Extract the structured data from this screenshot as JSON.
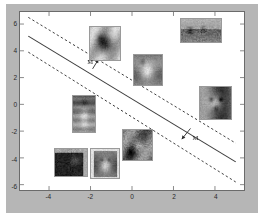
{
  "figure": {
    "background_color": "#b6b6b6",
    "axes_background": "#ffffff",
    "axes_border_color": "#6b6b6b"
  },
  "chart_data": {
    "type": "scatter",
    "title": "",
    "subtitle": "",
    "xlabel": "",
    "ylabel": "",
    "xlim": [
      -5.4,
      5.4
    ],
    "ylim": [
      -6.4,
      6.9
    ],
    "grid": false,
    "legend": null,
    "xticks": [
      -4,
      -2,
      0,
      2,
      4
    ],
    "xtick_labels": [
      "-4",
      "-2",
      "0",
      "2",
      "4"
    ],
    "yticks": [
      -6,
      -4,
      -2,
      0,
      2,
      4,
      6
    ],
    "ytick_labels": [
      "-6",
      "-4",
      "-2",
      "0",
      "2",
      "4",
      "6"
    ],
    "lines": [
      {
        "name": "decision-boundary",
        "style": "solid",
        "color": "#3d3d3d",
        "width": 1.1,
        "x": [
          -5.0,
          5.0
        ],
        "y": [
          5.1,
          -4.3
        ]
      },
      {
        "name": "upper-margin",
        "style": "dashed",
        "color": "#3d3d3d",
        "width": 1.0,
        "x": [
          -5.0,
          5.0
        ],
        "y": [
          6.5,
          -2.9
        ]
      },
      {
        "name": "lower-margin",
        "style": "dashed",
        "color": "#3d3d3d",
        "width": 1.0,
        "x": [
          -5.0,
          5.0
        ],
        "y": [
          3.9,
          -5.8
        ]
      }
    ],
    "annotations": [
      {
        "name": "margin-label-upper",
        "text": "M",
        "text_x": -2.05,
        "text_y": 3.25,
        "arrow_from_x": -1.9,
        "arrow_from_y": 2.65,
        "arrow_to_x": -1.62,
        "arrow_to_y": 3.35
      },
      {
        "name": "margin-label-lower",
        "text": "M",
        "text_x": 2.98,
        "text_y": -2.35,
        "arrow_from_x": 2.82,
        "arrow_from_y": -1.8,
        "arrow_to_x": 2.4,
        "arrow_to_y": -2.6
      }
    ],
    "points": [
      {
        "name": "thumbnail-dark-dog",
        "label": "dark dog photo",
        "x": -1.35,
        "y": 4.55,
        "width_px": 32,
        "height_px": 35,
        "texture": "dark-dog"
      },
      {
        "name": "thumbnail-landscape",
        "label": "outdoor landscape photo",
        "x": 3.25,
        "y": 5.55,
        "width_px": 42,
        "height_px": 25,
        "texture": "landscape"
      },
      {
        "name": "thumbnail-light-cat",
        "label": "light cat photo",
        "x": 0.72,
        "y": 2.65,
        "width_px": 30,
        "height_px": 32,
        "texture": "light-cat"
      },
      {
        "name": "thumbnail-bulldog",
        "label": "bulldog face photo",
        "x": 3.95,
        "y": 0.15,
        "width_px": 33,
        "height_px": 34,
        "texture": "bulldog"
      },
      {
        "name": "thumbnail-sitting-cat",
        "label": "sitting cat portrait photo",
        "x": -2.35,
        "y": -0.65,
        "width_px": 24,
        "height_px": 38,
        "texture": "sitting-cat"
      },
      {
        "name": "thumbnail-cat-face",
        "label": "cat face close-up photo",
        "x": 0.2,
        "y": -2.9,
        "width_px": 31,
        "height_px": 32,
        "texture": "cat-face"
      },
      {
        "name": "thumbnail-black-cat",
        "label": "black cat photo",
        "x": -2.95,
        "y": -4.25,
        "width_px": 34,
        "height_px": 29,
        "texture": "black-cat"
      },
      {
        "name": "thumbnail-white-kitten",
        "label": "white kitten photo",
        "x": -1.35,
        "y": -4.3,
        "width_px": 30,
        "height_px": 31,
        "texture": "white-kitten"
      }
    ]
  }
}
